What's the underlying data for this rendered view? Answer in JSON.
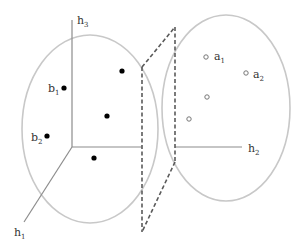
{
  "diagram": {
    "colors": {
      "ellipse": "#c8c8c8",
      "axis": "#8c8c8c",
      "plane": "#5a5a5a",
      "point_fill": "#000000",
      "hollow_point": "#777777",
      "text": "#333333"
    },
    "left_space": {
      "axes": {
        "h3": {
          "label": "h",
          "sub": "3"
        },
        "h1": {
          "label": "h",
          "sub": "1"
        }
      },
      "points": [
        {
          "label": "b",
          "sub": "1",
          "x": 64,
          "y": 88
        },
        {
          "label": "b",
          "sub": "2",
          "x": 47,
          "y": 136
        },
        {
          "label": "",
          "sub": "",
          "x": 122,
          "y": 71
        },
        {
          "label": "",
          "sub": "",
          "x": 107,
          "y": 116
        },
        {
          "label": "",
          "sub": "",
          "x": 94,
          "y": 158
        }
      ]
    },
    "right_space": {
      "axes": {
        "h2": {
          "label": "h",
          "sub": "2"
        }
      },
      "points": [
        {
          "label": "a",
          "sub": "1",
          "x": 206,
          "y": 57
        },
        {
          "label": "a",
          "sub": "2",
          "x": 246,
          "y": 73
        },
        {
          "label": "",
          "sub": "",
          "x": 207,
          "y": 97
        },
        {
          "label": "",
          "sub": "",
          "x": 189,
          "y": 119
        }
      ]
    }
  }
}
